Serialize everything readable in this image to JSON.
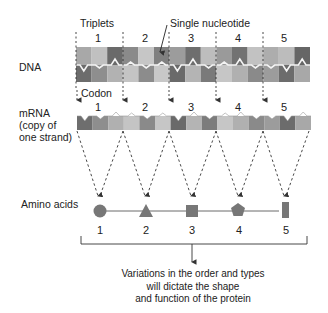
{
  "labels": {
    "triplets": "Triplets",
    "single_nucleotide": "Single nucleotide",
    "dna": "DNA",
    "codon": "Codon",
    "mrna_line1": "mRNA",
    "mrna_line2": "(copy of",
    "mrna_line3": "one strand)",
    "amino_acids": "Amino acids"
  },
  "triplet_numbers": [
    "1",
    "2",
    "3",
    "4",
    "5"
  ],
  "codon_numbers": [
    "1",
    "2",
    "3",
    "4",
    "5"
  ],
  "amino_acids": [
    {
      "number": "1",
      "shape": "circle"
    },
    {
      "number": "2",
      "shape": "triangle"
    },
    {
      "number": "3",
      "shape": "square"
    },
    {
      "number": "4",
      "shape": "pentagon"
    },
    {
      "number": "5",
      "shape": "rectangle"
    }
  ],
  "caption": {
    "line1": "Variations in the order and types",
    "line2": "will dictate the shape",
    "line3": "and function of the protein"
  },
  "colors": {
    "dark": "#6e6e6e",
    "mid": "#9a9a9a",
    "light": "#c4c4c4",
    "shape_fill": "#777777",
    "line": "#333333"
  }
}
